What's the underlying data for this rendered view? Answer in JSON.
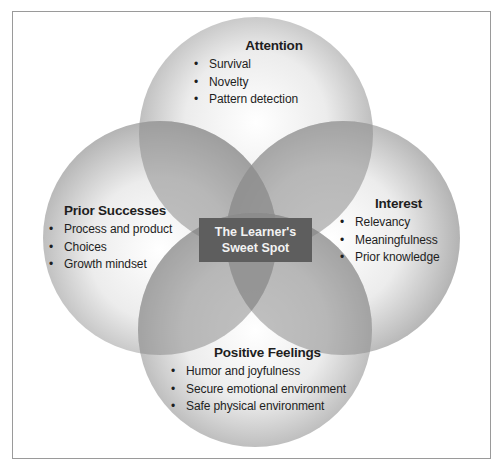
{
  "diagram": {
    "type": "venn-4",
    "center_label": {
      "line1": "The Learner's",
      "line2": "Sweet Spot"
    },
    "circles": [
      {
        "id": "attention",
        "title": "Attention",
        "items": [
          "Survival",
          "Novelty",
          "Pattern detection"
        ]
      },
      {
        "id": "prior-successes",
        "title": "Prior Successes",
        "items": [
          "Process and product",
          "Choices",
          "Growth mindset"
        ]
      },
      {
        "id": "interest",
        "title": "Interest",
        "items": [
          "Relevancy",
          "Meaningfulness",
          "Prior knowledge"
        ]
      },
      {
        "id": "positive-feelings",
        "title": "Positive Feelings",
        "items": [
          "Humor and joyfulness",
          "Secure emotional environment",
          "Safe physical environment"
        ]
      }
    ],
    "colors": {
      "circle_light": "#f4f4f4",
      "circle_dark": "#b9b9b9",
      "overlap": "#8f8f8f",
      "center_box": "#5e5e5e",
      "center_text": "#f2f2f2",
      "frame": "#9a9a9a"
    }
  }
}
